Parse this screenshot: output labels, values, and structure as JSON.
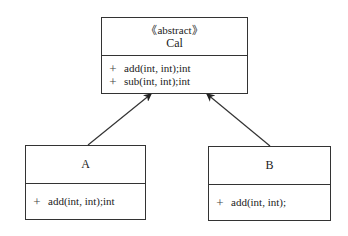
{
  "diagram": {
    "type": "uml-class-diagram",
    "classes": [
      {
        "id": "cal",
        "stereotype": "《abstract》",
        "name": "Cal",
        "operations": [
          {
            "visibility": "+",
            "signature": "add(int, int);int"
          },
          {
            "visibility": "+",
            "signature": "sub(int, int);int"
          }
        ]
      },
      {
        "id": "a",
        "name": "A",
        "operations": [
          {
            "visibility": "+",
            "signature": "add(int, int);int"
          }
        ]
      },
      {
        "id": "b",
        "name": "B",
        "operations": [
          {
            "visibility": "+",
            "signature": "add(int, int);"
          }
        ]
      }
    ],
    "relations": [
      {
        "from": "A",
        "to": "Cal",
        "kind": "association-arrow"
      },
      {
        "from": "B",
        "to": "Cal",
        "kind": "association-arrow"
      }
    ],
    "colors": {
      "line": "#333333",
      "text": "#222222",
      "background": "#ffffff"
    }
  }
}
